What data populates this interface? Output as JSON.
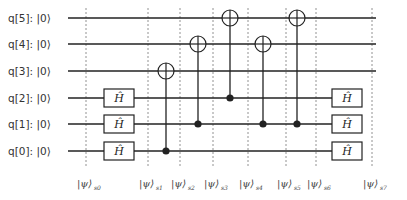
{
  "circuit": {
    "colors": {
      "wire": "#222222",
      "divider": "#777777",
      "gate_fill": "#ffffff",
      "text": "#333333"
    },
    "qubits": [
      {
        "label": "q[5]: |0⟩",
        "y": 18
      },
      {
        "label": "q[4]: |0⟩",
        "y": 44
      },
      {
        "label": "q[3]: |0⟩",
        "y": 71
      },
      {
        "label": "q[2]: |0⟩",
        "y": 98
      },
      {
        "label": "q[1]: |0⟩",
        "y": 124
      },
      {
        "label": "q[0]: |0⟩",
        "y": 151
      }
    ],
    "gates": [
      {
        "type": "H",
        "label": "Ĥ",
        "qubit": 2,
        "x": 119
      },
      {
        "type": "H",
        "label": "Ĥ",
        "qubit": 1,
        "x": 119
      },
      {
        "type": "H",
        "label": "Ĥ",
        "qubit": 0,
        "x": 119
      },
      {
        "type": "CNOT",
        "control": 0,
        "target": 3,
        "x": 166
      },
      {
        "type": "CNOT",
        "control": 1,
        "target": 4,
        "x": 198
      },
      {
        "type": "CNOT",
        "control": 2,
        "target": 5,
        "x": 230
      },
      {
        "type": "CNOT",
        "control": 1,
        "target": 4,
        "x": 263
      },
      {
        "type": "CNOT",
        "control": 1,
        "target": 5,
        "x": 297
      },
      {
        "type": "H",
        "label": "Ĥ",
        "qubit": 2,
        "x": 347
      },
      {
        "type": "H",
        "label": "Ĥ",
        "qubit": 1,
        "x": 347
      },
      {
        "type": "H",
        "label": "Ĥ",
        "qubit": 0,
        "x": 347
      }
    ],
    "states": [
      {
        "label": "|ψ⟩",
        "sub": "s0",
        "x": 86
      },
      {
        "label": "|ψ⟩",
        "sub": "s1",
        "x": 148
      },
      {
        "label": "|ψ⟩",
        "sub": "s2",
        "x": 180
      },
      {
        "label": "|ψ⟩",
        "sub": "s3",
        "x": 213
      },
      {
        "label": "|ψ⟩",
        "sub": "s4",
        "x": 248
      },
      {
        "label": "|ψ⟩",
        "sub": "s5",
        "x": 286
      },
      {
        "label": "|ψ⟩",
        "sub": "s6",
        "x": 316
      },
      {
        "label": "|ψ⟩",
        "sub": "s7",
        "x": 372
      }
    ]
  }
}
